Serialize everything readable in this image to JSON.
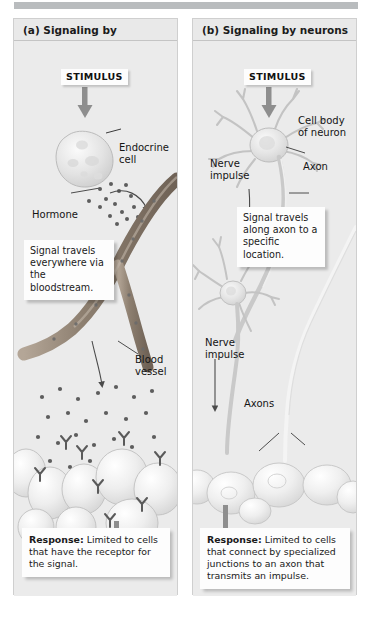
{
  "figure": {
    "panels": [
      {
        "id": "a",
        "header": "(a) Signaling by hormones",
        "stimulus": "STIMULUS",
        "callout": "Signal travels everywhere via the bloodstream.",
        "response_lead": "Response:",
        "response_text": " Limited to cells that have the receptor for the signal.",
        "labels": {
          "endocrine_cell": "Endocrine\ncell",
          "hormone": "Hormone",
          "blood_vessel": "Blood\nvessel"
        }
      },
      {
        "id": "b",
        "header": "(b) Signaling by neurons",
        "stimulus": "STIMULUS",
        "callout": "Signal travels along axon to a specific location.",
        "response_lead": "Response:",
        "response_text": " Limited to cells that connect by specialized junctions to an axon that transmits an impulse.",
        "labels": {
          "cell_body": "Cell body\nof neuron",
          "axon": "Axon",
          "nerve_impulse_1": "Nerve\nimpulse",
          "nerve_impulse_2": "Nerve\nimpulse",
          "axons": "Axons"
        }
      }
    ]
  },
  "colors": {
    "panel_background": "#ebebeb",
    "panel_border": "#cfcfcf",
    "top_bar": "#b9bcbe",
    "arrow_gray": "#8e8e8e",
    "blood_vessel": "#9a8c7d",
    "hormone_dot": "#5d5d5d",
    "receptor": "#6e6e6e",
    "cell_fill": "#f2f2f2",
    "box_white": "#fdfdfd",
    "text": "#141414"
  }
}
